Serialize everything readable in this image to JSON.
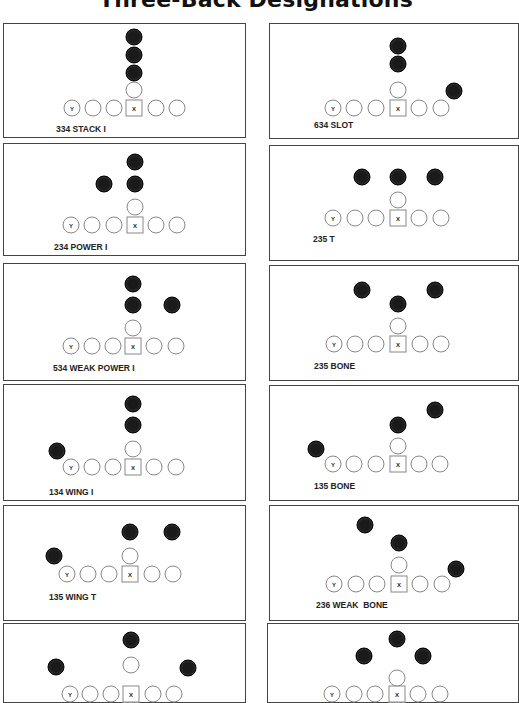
{
  "page": {
    "title": "Three-Back Designations"
  },
  "formations": [
    {
      "id": "f1",
      "name": "334 STACK I",
      "box": {
        "x": 3,
        "y": 23,
        "w": 243,
        "h": 115
      },
      "label_pos": {
        "x": 52,
        "y": 100
      },
      "line": {
        "y": 84,
        "xs": [
          68,
          89,
          110,
          130,
          152,
          173
        ],
        "ends_marker": "Y",
        "center_marker": "X"
      },
      "qb": {
        "x": 130,
        "y": 66
      },
      "backs": [
        {
          "x": 130,
          "y": 13
        },
        {
          "x": 130,
          "y": 31
        },
        {
          "x": 130,
          "y": 49
        }
      ]
    },
    {
      "id": "f2",
      "name": "234 POWER I",
      "box": {
        "x": 3,
        "y": 143,
        "w": 243,
        "h": 113
      },
      "label_pos": {
        "x": 50,
        "y": 98
      },
      "line": {
        "y": 81,
        "xs": [
          67,
          88,
          110,
          131,
          152,
          173
        ],
        "ends_marker": "Y",
        "center_marker": "X"
      },
      "qb": {
        "x": 131,
        "y": 63
      },
      "backs": [
        {
          "x": 131,
          "y": 18
        },
        {
          "x": 100,
          "y": 40
        },
        {
          "x": 131,
          "y": 40
        }
      ]
    },
    {
      "id": "f3",
      "name": "534 WEAK POWER I",
      "box": {
        "x": 3,
        "y": 263,
        "w": 243,
        "h": 118
      },
      "label_pos": {
        "x": 49,
        "y": 99
      },
      "line": {
        "y": 82,
        "xs": [
          67,
          88,
          109,
          129,
          150,
          172
        ],
        "ends_marker": "Y",
        "center_marker": "X"
      },
      "qb": {
        "x": 129,
        "y": 64
      },
      "backs": [
        {
          "x": 129,
          "y": 20
        },
        {
          "x": 129,
          "y": 41
        },
        {
          "x": 168,
          "y": 41
        }
      ]
    },
    {
      "id": "f4",
      "name": "134 WING I",
      "box": {
        "x": 3,
        "y": 384,
        "w": 243,
        "h": 117
      },
      "label_pos": {
        "x": 45,
        "y": 102
      },
      "line": {
        "y": 82,
        "xs": [
          67,
          88,
          109,
          129,
          150,
          172
        ],
        "ends_marker": "Y",
        "center_marker": "X"
      },
      "qb": {
        "x": 129,
        "y": 64
      },
      "backs": [
        {
          "x": 129,
          "y": 19
        },
        {
          "x": 129,
          "y": 40
        },
        {
          "x": 53,
          "y": 66
        }
      ]
    },
    {
      "id": "f5",
      "name": "135 WING T",
      "box": {
        "x": 3,
        "y": 505,
        "w": 243,
        "h": 116
      },
      "label_pos": {
        "x": 45,
        "y": 86
      },
      "line": {
        "y": 68,
        "xs": [
          63,
          84,
          105,
          126,
          148,
          169
        ],
        "ends_marker": "Y",
        "center_marker": "X"
      },
      "qb": {
        "x": 126,
        "y": 50
      },
      "backs": [
        {
          "x": 126,
          "y": 26
        },
        {
          "x": 168,
          "y": 26
        },
        {
          "x": 50,
          "y": 50
        }
      ]
    },
    {
      "id": "f6",
      "name": "",
      "box": {
        "x": 3,
        "y": 623,
        "w": 243,
        "h": 80
      },
      "label_pos": {
        "x": 45,
        "y": 90
      },
      "line": {
        "y": 70,
        "xs": [
          66,
          86,
          107,
          127,
          149,
          170
        ],
        "ends_marker": "Y",
        "center_marker": "X"
      },
      "qb": {
        "x": 127,
        "y": 41
      },
      "backs": [
        {
          "x": 127,
          "y": 16
        },
        {
          "x": 52,
          "y": 43
        },
        {
          "x": 184,
          "y": 44
        }
      ]
    },
    {
      "id": "f7",
      "name": "634 SLOT",
      "box": {
        "x": 269,
        "y": 23,
        "w": 250,
        "h": 116
      },
      "label_pos": {
        "x": 44,
        "y": 96
      },
      "line": {
        "y": 84,
        "xs": [
          63,
          84,
          106,
          128,
          149,
          171
        ],
        "ends_marker": "Y",
        "center_marker": "X"
      },
      "qb": {
        "x": 128,
        "y": 66
      },
      "backs": [
        {
          "x": 128,
          "y": 22
        },
        {
          "x": 128,
          "y": 40
        },
        {
          "x": 184,
          "y": 67
        }
      ]
    },
    {
      "id": "f8",
      "name": "235 T",
      "box": {
        "x": 269,
        "y": 145,
        "w": 250,
        "h": 116
      },
      "label_pos": {
        "x": 43,
        "y": 88
      },
      "line": {
        "y": 72,
        "xs": [
          63,
          85,
          106,
          128,
          149,
          171
        ],
        "ends_marker": "Y",
        "center_marker": "X"
      },
      "qb": {
        "x": 128,
        "y": 54
      },
      "backs": [
        {
          "x": 92,
          "y": 31
        },
        {
          "x": 128,
          "y": 31
        },
        {
          "x": 165,
          "y": 31
        }
      ]
    },
    {
      "id": "f9",
      "name": "235 BONE",
      "box": {
        "x": 269,
        "y": 265,
        "w": 250,
        "h": 116
      },
      "label_pos": {
        "x": 44,
        "y": 95
      },
      "line": {
        "y": 78,
        "xs": [
          64,
          85,
          106,
          128,
          150,
          171
        ],
        "ends_marker": "Y",
        "center_marker": "X"
      },
      "qb": {
        "x": 128,
        "y": 60
      },
      "backs": [
        {
          "x": 92,
          "y": 24
        },
        {
          "x": 165,
          "y": 24
        },
        {
          "x": 128,
          "y": 38
        }
      ]
    },
    {
      "id": "f10",
      "name": "135 BONE",
      "box": {
        "x": 269,
        "y": 385,
        "w": 250,
        "h": 116
      },
      "label_pos": {
        "x": 44,
        "y": 95
      },
      "line": {
        "y": 78,
        "xs": [
          63,
          84,
          106,
          128,
          149,
          170
        ],
        "ends_marker": "Y",
        "center_marker": "X"
      },
      "qb": {
        "x": 128,
        "y": 60
      },
      "backs": [
        {
          "x": 165,
          "y": 24
        },
        {
          "x": 128,
          "y": 39
        },
        {
          "x": 46,
          "y": 63
        }
      ]
    },
    {
      "id": "f11",
      "name": "236 WEAK  BONE",
      "box": {
        "x": 269,
        "y": 505,
        "w": 250,
        "h": 116
      },
      "label_pos": {
        "x": 46,
        "y": 94
      },
      "line": {
        "y": 78,
        "xs": [
          64,
          86,
          107,
          129,
          150,
          172
        ],
        "ends_marker": "Y",
        "center_marker": "X"
      },
      "qb": {
        "x": 129,
        "y": 59
      },
      "backs": [
        {
          "x": 95,
          "y": 19
        },
        {
          "x": 129,
          "y": 37
        },
        {
          "x": 186,
          "y": 63
        }
      ]
    },
    {
      "id": "f12",
      "name": "",
      "box": {
        "x": 267,
        "y": 623,
        "w": 252,
        "h": 80
      },
      "label_pos": {
        "x": 44,
        "y": 90
      },
      "line": {
        "y": 70,
        "xs": [
          64,
          86,
          107,
          129,
          150,
          172
        ],
        "ends_marker": "Y",
        "center_marker": "X"
      },
      "qb": {
        "x": 129,
        "y": 54
      },
      "backs": [
        {
          "x": 129,
          "y": 15
        },
        {
          "x": 96,
          "y": 32
        },
        {
          "x": 155,
          "y": 32
        }
      ]
    }
  ],
  "colors": {
    "back_fill": "#1a1a1a",
    "lineman_stroke": "#888888",
    "box_border": "#444444"
  }
}
